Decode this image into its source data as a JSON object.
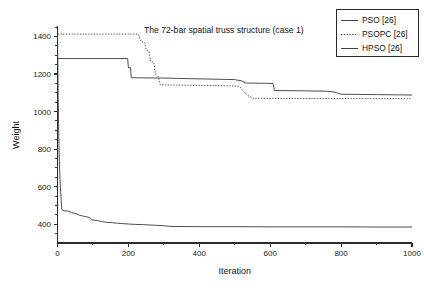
{
  "chart_data": {
    "type": "line",
    "title": "The 72-bar spatial truss structure (case 1)",
    "xlabel": "Iteration",
    "ylabel": "Weight",
    "xlim": [
      0,
      1000
    ],
    "ylim": [
      300,
      1450
    ],
    "xticks": [
      0,
      200,
      400,
      600,
      800,
      1000
    ],
    "xticklabels": [
      "0",
      "200",
      "400",
      "600",
      "800",
      "1000"
    ],
    "yticks": [
      400,
      600,
      800,
      1000,
      1200,
      1400
    ],
    "yticklabels": [
      "400",
      "600",
      "800",
      "1000",
      "1200",
      "1400"
    ],
    "xminorticks": [
      100,
      300,
      500,
      700,
      900
    ],
    "yminorticks": [
      350,
      450,
      500,
      550,
      650,
      700,
      750,
      850,
      900,
      950,
      1050,
      1100,
      1150,
      1250,
      1300,
      1350,
      1450
    ],
    "grid": false,
    "legend_position": "top-right",
    "series": [
      {
        "name": "PSO [26]",
        "style": "solid",
        "color": "#3a3a3a",
        "width": 0.9,
        "points": [
          [
            0,
            1282
          ],
          [
            198,
            1282
          ],
          [
            200,
            1233
          ],
          [
            206,
            1233
          ],
          [
            208,
            1180
          ],
          [
            300,
            1178
          ],
          [
            420,
            1173
          ],
          [
            500,
            1170
          ],
          [
            505,
            1168
          ],
          [
            520,
            1163
          ],
          [
            530,
            1152
          ],
          [
            590,
            1150
          ],
          [
            608,
            1149
          ],
          [
            612,
            1112
          ],
          [
            700,
            1110
          ],
          [
            760,
            1108
          ],
          [
            780,
            1104
          ],
          [
            800,
            1092
          ],
          [
            900,
            1090
          ],
          [
            1000,
            1088
          ]
        ]
      },
      {
        "name": "PSOPC [26]",
        "style": "dotted",
        "color": "#3a3a3a",
        "width": 0.9,
        "points": [
          [
            0,
            1412
          ],
          [
            228,
            1412
          ],
          [
            236,
            1372
          ],
          [
            246,
            1368
          ],
          [
            250,
            1330
          ],
          [
            258,
            1322
          ],
          [
            262,
            1268
          ],
          [
            272,
            1262
          ],
          [
            276,
            1200
          ],
          [
            284,
            1185
          ],
          [
            290,
            1142
          ],
          [
            360,
            1140
          ],
          [
            440,
            1138
          ],
          [
            500,
            1136
          ],
          [
            516,
            1130
          ],
          [
            528,
            1098
          ],
          [
            540,
            1082
          ],
          [
            552,
            1070
          ],
          [
            640,
            1070
          ],
          [
            800,
            1069
          ],
          [
            1000,
            1068
          ]
        ]
      },
      {
        "name": "HPSO [26]",
        "style": "solid",
        "color": "#3a3a3a",
        "width": 0.9,
        "points": [
          [
            0,
            1400
          ],
          [
            2,
            1060
          ],
          [
            4,
            830
          ],
          [
            6,
            690
          ],
          [
            8,
            600
          ],
          [
            10,
            540
          ],
          [
            12,
            480
          ],
          [
            16,
            472
          ],
          [
            30,
            470
          ],
          [
            40,
            462
          ],
          [
            55,
            455
          ],
          [
            62,
            448
          ],
          [
            70,
            444
          ],
          [
            80,
            440
          ],
          [
            90,
            436
          ],
          [
            95,
            424
          ],
          [
            104,
            421
          ],
          [
            112,
            420
          ],
          [
            125,
            414
          ],
          [
            140,
            410
          ],
          [
            155,
            408
          ],
          [
            170,
            405
          ],
          [
            185,
            403
          ],
          [
            200,
            401
          ],
          [
            220,
            399
          ],
          [
            240,
            398
          ],
          [
            260,
            396
          ],
          [
            280,
            394
          ],
          [
            300,
            392
          ],
          [
            320,
            388
          ],
          [
            400,
            387
          ],
          [
            500,
            387
          ],
          [
            600,
            386
          ],
          [
            700,
            386
          ],
          [
            800,
            386
          ],
          [
            900,
            385
          ],
          [
            1000,
            385
          ]
        ]
      }
    ]
  },
  "legend": {
    "entries": [
      {
        "label": "PSO [26]",
        "style": "solid"
      },
      {
        "label": "PSOPC [26]",
        "style": "dotted"
      },
      {
        "label": "HPSO [26]",
        "style": "solid"
      }
    ]
  }
}
